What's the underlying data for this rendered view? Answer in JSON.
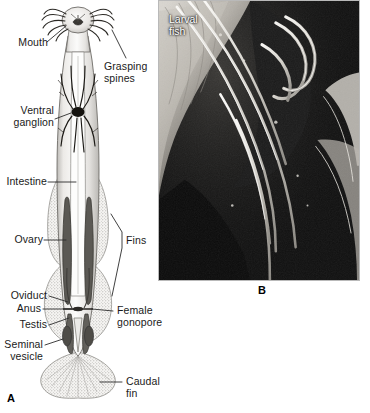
{
  "figure": {
    "panels": [
      {
        "id": "A",
        "type": "line-drawing",
        "subject": "arrow worm ventral anatomy",
        "labels_left": [
          {
            "text": "Mouth",
            "name": "label-mouth"
          },
          {
            "text": "Ventral\nganglion",
            "name": "label-ventral-ganglion"
          },
          {
            "text": "Intestine",
            "name": "label-intestine"
          },
          {
            "text": "Ovary",
            "name": "label-ovary"
          },
          {
            "text": "Oviduct",
            "name": "label-oviduct"
          },
          {
            "text": "Anus",
            "name": "label-anus"
          },
          {
            "text": "Testis",
            "name": "label-testis"
          },
          {
            "text": "Seminal\nvesicle",
            "name": "label-seminal-vesicle"
          }
        ],
        "labels_right": [
          {
            "text": "Grasping\nspines",
            "name": "label-grasping-spines"
          },
          {
            "text": "Fins",
            "name": "label-fins"
          },
          {
            "text": "Female\ngonopore",
            "name": "label-female-gonopore"
          },
          {
            "text": "Caudal\nfin",
            "name": "label-caudal-fin"
          }
        ]
      },
      {
        "id": "B",
        "type": "electron-micrograph",
        "overlay_label": "Larval\nfish"
      }
    ],
    "colors": {
      "ink": "#1a1a1a",
      "leader": "#2b2b2b",
      "body_fill": "#f2f1ef",
      "fin_stipple": "#b6b4b0",
      "organ_dark": "#4a4844",
      "micro_dark": "#0e0e0e",
      "micro_light": "#e8e6e1"
    }
  }
}
